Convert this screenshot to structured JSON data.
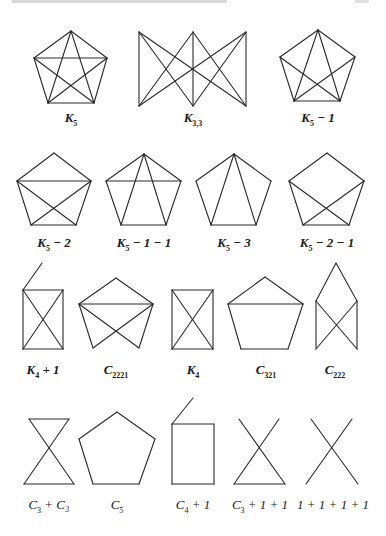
{
  "figure": {
    "edge_color": "#2a2a2a",
    "graphs": [
      {
        "id": "K5",
        "label_main": "K",
        "label_sub": "5",
        "label_tail": "",
        "label_x": 71,
        "label_y": 110,
        "bold": true,
        "vertices": [
          [
            71,
            31
          ],
          [
            34,
            58
          ],
          [
            107,
            58
          ],
          [
            48,
            103
          ],
          [
            94,
            103
          ]
        ],
        "edges": [
          [
            0,
            1
          ],
          [
            0,
            2
          ],
          [
            1,
            3
          ],
          [
            2,
            4
          ],
          [
            3,
            4
          ],
          [
            1,
            2
          ],
          [
            0,
            3
          ],
          [
            0,
            4
          ],
          [
            1,
            4
          ],
          [
            2,
            3
          ]
        ]
      },
      {
        "id": "K33",
        "label_main": "K",
        "label_sub": "3,3",
        "label_tail": "",
        "label_x": 193,
        "label_y": 110,
        "bold": true,
        "vertices": [
          [
            139,
            32
          ],
          [
            193,
            32
          ],
          [
            246,
            32
          ],
          [
            139,
            106
          ],
          [
            193,
            106
          ],
          [
            246,
            106
          ]
        ],
        "edges": [
          [
            0,
            3
          ],
          [
            0,
            4
          ],
          [
            0,
            5
          ],
          [
            1,
            3
          ],
          [
            1,
            4
          ],
          [
            1,
            5
          ],
          [
            2,
            3
          ],
          [
            2,
            4
          ],
          [
            2,
            5
          ]
        ]
      },
      {
        "id": "K5-1",
        "label_main": "K",
        "label_sub": "5",
        "label_tail": " − 1",
        "label_x": 318,
        "label_y": 110,
        "bold": true,
        "vertices": [
          [
            318,
            30
          ],
          [
            280,
            57
          ],
          [
            355,
            57
          ],
          [
            294,
            101
          ],
          [
            340,
            101
          ]
        ],
        "edges": [
          [
            0,
            1
          ],
          [
            0,
            2
          ],
          [
            1,
            3
          ],
          [
            2,
            4
          ],
          [
            3,
            4
          ],
          [
            0,
            3
          ],
          [
            0,
            4
          ],
          [
            1,
            4
          ],
          [
            2,
            3
          ]
        ]
      },
      {
        "id": "K5-2",
        "label_main": "K",
        "label_sub": "5",
        "label_tail": " − 2",
        "label_x": 54,
        "label_y": 235,
        "bold": true,
        "vertices": [
          [
            54,
            153
          ],
          [
            17,
            181
          ],
          [
            91,
            181
          ],
          [
            31,
            225
          ],
          [
            76,
            225
          ]
        ],
        "edges": [
          [
            0,
            1
          ],
          [
            0,
            2
          ],
          [
            1,
            3
          ],
          [
            2,
            4
          ],
          [
            3,
            4
          ],
          [
            1,
            2
          ],
          [
            1,
            4
          ],
          [
            2,
            3
          ]
        ]
      },
      {
        "id": "K5-1-1",
        "label_main": "K",
        "label_sub": "5",
        "label_tail": " − 1 − 1",
        "label_x": 144,
        "label_y": 235,
        "bold": true,
        "vertices": [
          [
            144,
            154
          ],
          [
            106,
            181
          ],
          [
            181,
            181
          ],
          [
            121,
            225
          ],
          [
            166,
            225
          ]
        ],
        "edges": [
          [
            0,
            1
          ],
          [
            0,
            2
          ],
          [
            1,
            3
          ],
          [
            2,
            4
          ],
          [
            3,
            4
          ],
          [
            1,
            2
          ],
          [
            0,
            3
          ],
          [
            0,
            4
          ]
        ]
      },
      {
        "id": "K5-3",
        "label_main": "K",
        "label_sub": "5",
        "label_tail": " − 3",
        "label_x": 234,
        "label_y": 235,
        "bold": true,
        "vertices": [
          [
            234,
            154
          ],
          [
            196,
            181
          ],
          [
            271,
            181
          ],
          [
            211,
            225
          ],
          [
            256,
            225
          ]
        ],
        "edges": [
          [
            0,
            1
          ],
          [
            0,
            2
          ],
          [
            1,
            3
          ],
          [
            2,
            4
          ],
          [
            3,
            4
          ],
          [
            0,
            3
          ],
          [
            0,
            4
          ]
        ]
      },
      {
        "id": "K5-2-1",
        "label_main": "K",
        "label_sub": "5",
        "label_tail": " − 2 − 1",
        "label_x": 327,
        "label_y": 235,
        "bold": true,
        "vertices": [
          [
            327,
            153
          ],
          [
            289,
            181
          ],
          [
            364,
            181
          ],
          [
            303,
            225
          ],
          [
            349,
            225
          ]
        ],
        "edges": [
          [
            0,
            1
          ],
          [
            0,
            2
          ],
          [
            1,
            3
          ],
          [
            2,
            4
          ],
          [
            3,
            4
          ],
          [
            1,
            4
          ],
          [
            2,
            3
          ]
        ]
      },
      {
        "id": "K4+1",
        "label_main": "K",
        "label_sub": "4",
        "label_tail": " + 1",
        "label_x": 43,
        "label_y": 362,
        "bold": true,
        "vertices": [
          [
            23,
            290
          ],
          [
            63,
            290
          ],
          [
            23,
            349
          ],
          [
            63,
            349
          ],
          [
            42,
            263
          ]
        ],
        "edges": [
          [
            0,
            1
          ],
          [
            1,
            3
          ],
          [
            3,
            2
          ],
          [
            2,
            0
          ],
          [
            0,
            3
          ],
          [
            1,
            2
          ],
          [
            0,
            4
          ]
        ]
      },
      {
        "id": "C2221",
        "label_main": "C",
        "label_sub": "2221",
        "label_tail": "",
        "label_x": 116,
        "label_y": 362,
        "bold": true,
        "vertices": [
          [
            116,
            278
          ],
          [
            79,
            304
          ],
          [
            153,
            304
          ],
          [
            93,
            348
          ],
          [
            139,
            348
          ]
        ],
        "edges": [
          [
            0,
            1
          ],
          [
            0,
            2
          ],
          [
            1,
            2
          ],
          [
            1,
            3
          ],
          [
            2,
            4
          ],
          [
            1,
            4
          ],
          [
            2,
            3
          ]
        ]
      },
      {
        "id": "K4",
        "label_main": "K",
        "label_sub": "4",
        "label_tail": "",
        "label_x": 193,
        "label_y": 362,
        "bold": true,
        "vertices": [
          [
            172,
            290
          ],
          [
            213,
            290
          ],
          [
            172,
            349
          ],
          [
            213,
            349
          ]
        ],
        "edges": [
          [
            0,
            1
          ],
          [
            1,
            3
          ],
          [
            3,
            2
          ],
          [
            2,
            0
          ],
          [
            0,
            3
          ],
          [
            1,
            2
          ]
        ]
      },
      {
        "id": "C321",
        "label_main": "C",
        "label_sub": "321",
        "label_tail": "",
        "label_x": 266,
        "label_y": 362,
        "bold": true,
        "vertices": [
          [
            265,
            277
          ],
          [
            228,
            304
          ],
          [
            303,
            304
          ],
          [
            241,
            349
          ],
          [
            288,
            349
          ]
        ],
        "edges": [
          [
            0,
            1
          ],
          [
            0,
            2
          ],
          [
            1,
            3
          ],
          [
            2,
            4
          ],
          [
            3,
            4
          ],
          [
            1,
            2
          ]
        ]
      },
      {
        "id": "C222",
        "label_main": "C",
        "label_sub": "222",
        "label_tail": "",
        "label_x": 335,
        "label_y": 362,
        "bold": true,
        "vertices": [
          [
            336,
            263
          ],
          [
            316,
            301
          ],
          [
            357,
            301
          ],
          [
            316,
            349
          ],
          [
            357,
            349
          ]
        ],
        "edges": [
          [
            0,
            1
          ],
          [
            0,
            2
          ],
          [
            1,
            3
          ],
          [
            2,
            4
          ],
          [
            1,
            4
          ],
          [
            2,
            3
          ]
        ]
      },
      {
        "id": "C3+C3",
        "label_main": "C",
        "label_sub": "3",
        "label_tail": " + C₃",
        "label_x": 49,
        "label_y": 497,
        "bold": false,
        "vertices": [
          [
            29,
            419
          ],
          [
            69,
            419
          ],
          [
            49,
            451
          ],
          [
            24,
            484
          ],
          [
            74,
            484
          ]
        ],
        "edges": [
          [
            0,
            1
          ],
          [
            0,
            4
          ],
          [
            1,
            3
          ],
          [
            3,
            4
          ]
        ]
      },
      {
        "id": "C5",
        "label_main": "C",
        "label_sub": "5",
        "label_tail": "",
        "label_x": 117,
        "label_y": 497,
        "bold": false,
        "vertices": [
          [
            117,
            412
          ],
          [
            79,
            439
          ],
          [
            155,
            439
          ],
          [
            93,
            484
          ],
          [
            139,
            484
          ]
        ],
        "edges": [
          [
            0,
            1
          ],
          [
            0,
            2
          ],
          [
            1,
            3
          ],
          [
            2,
            4
          ],
          [
            3,
            4
          ]
        ]
      },
      {
        "id": "C4+1",
        "label_main": "C",
        "label_sub": "4",
        "label_tail": " + 1",
        "label_x": 193,
        "label_y": 497,
        "bold": false,
        "vertices": [
          [
            172,
            424
          ],
          [
            214,
            424
          ],
          [
            172,
            484
          ],
          [
            214,
            484
          ],
          [
            193,
            398
          ]
        ],
        "edges": [
          [
            0,
            1
          ],
          [
            1,
            3
          ],
          [
            3,
            2
          ],
          [
            2,
            0
          ],
          [
            0,
            4
          ]
        ]
      },
      {
        "id": "C3+1+1",
        "label_main": "C",
        "label_sub": "3",
        "label_tail": " + 1 + 1",
        "label_x": 260,
        "label_y": 497,
        "bold": false,
        "vertices": [
          [
            239,
            419
          ],
          [
            285,
            484
          ],
          [
            279,
            419
          ],
          [
            234,
            484
          ]
        ],
        "edges": [
          [
            0,
            1
          ],
          [
            2,
            3
          ],
          [
            3,
            1
          ]
        ]
      },
      {
        "id": "1+1+1+1",
        "label_main": "",
        "label_sub": "",
        "label_tail": "1 + 1 + 1 + 1",
        "label_x": 333,
        "label_y": 497,
        "bold": false,
        "vertices": [
          [
            311,
            419
          ],
          [
            358,
            484
          ],
          [
            352,
            419
          ],
          [
            306,
            484
          ]
        ],
        "edges": [
          [
            0,
            1
          ],
          [
            2,
            3
          ]
        ]
      }
    ]
  }
}
